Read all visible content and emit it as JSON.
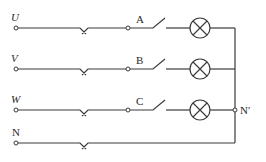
{
  "diagram": {
    "type": "three-phase four-wire lamp circuit",
    "lines": [
      {
        "id": "U",
        "label": "U",
        "italic": true,
        "y": 28,
        "switch_label": "A",
        "has_lamp": true
      },
      {
        "id": "V",
        "label": "V",
        "italic": true,
        "y": 69,
        "switch_label": "B",
        "has_lamp": true
      },
      {
        "id": "W",
        "label": "W",
        "italic": true,
        "y": 110,
        "switch_label": "C",
        "has_lamp": true
      },
      {
        "id": "N",
        "label": "N",
        "italic": false,
        "y": 143,
        "switch_label": null,
        "has_lamp": false
      }
    ],
    "neutral_node_label": "N′",
    "colors": {
      "wire": "#3a3a3a",
      "text": "#2a2a2a",
      "background": "#ffffff"
    }
  }
}
